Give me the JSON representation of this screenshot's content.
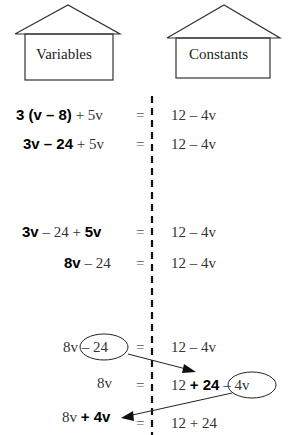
{
  "houses": {
    "left_label": "Variables",
    "right_label": "Constants"
  },
  "equals": "=",
  "rows": [
    {
      "left": [
        {
          "t": "3 (v – 8)",
          "bold": true
        },
        {
          "t": " + 5v",
          "bold": false
        }
      ],
      "right": [
        {
          "t": "12 – 4v",
          "bold": false
        }
      ]
    },
    {
      "left": [
        {
          "t": "3v – 24",
          "bold": true
        },
        {
          "t": " + 5v",
          "bold": false
        }
      ],
      "right": [
        {
          "t": "12 – 4v",
          "bold": false
        }
      ]
    },
    {
      "left": [
        {
          "t": "3v",
          "bold": true
        },
        {
          "t": " – 24 + ",
          "bold": false
        },
        {
          "t": "5v",
          "bold": true
        }
      ],
      "right": [
        {
          "t": "12 – 4v",
          "bold": false
        }
      ]
    },
    {
      "left": [
        {
          "t": "8v",
          "bold": true
        },
        {
          "t": " – 24",
          "bold": false
        }
      ],
      "right": [
        {
          "t": "12 – 4v",
          "bold": false
        }
      ]
    },
    {
      "left": [
        {
          "t": "8v ",
          "bold": false
        },
        {
          "t": "– 24",
          "bold": false,
          "circled": true
        }
      ],
      "right": [
        {
          "t": "12 – 4v",
          "bold": false
        }
      ]
    },
    {
      "left": [
        {
          "t": "8v",
          "bold": false
        }
      ],
      "right": [
        {
          "t": "12 ",
          "bold": false
        },
        {
          "t": "+ 24",
          "bold": true
        },
        {
          "t": " – 4v",
          "bold": false,
          "circled": true
        }
      ]
    },
    {
      "left": [
        {
          "t": "8v ",
          "bold": false
        },
        {
          "t": "+ 4v",
          "bold": true
        }
      ],
      "right": [
        {
          "t": "12 + 24",
          "bold": false
        }
      ]
    }
  ],
  "arrows": [
    {
      "from": "– 24 (row 5 left)",
      "to": "+ 24 (row 6 right)"
    },
    {
      "from": "– 4v (row 6 right)",
      "to": "+ 4v (row 7 left)"
    }
  ]
}
